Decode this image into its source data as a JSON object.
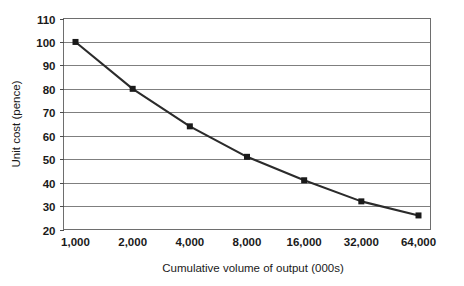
{
  "chart_data": {
    "type": "line",
    "title": "",
    "subtitle": "",
    "xlabel": "Cumulative volume of output (000s)",
    "ylabel": "Unit cost (pence)",
    "categories": [
      "1,000",
      "2,000",
      "4,000",
      "8,000",
      "16,000",
      "32,000",
      "64,000"
    ],
    "x_values": [
      1000,
      2000,
      4000,
      8000,
      16000,
      32000,
      64000
    ],
    "values": [
      100,
      80,
      64,
      51,
      41,
      32,
      26
    ],
    "series": [
      {
        "name": "Unit cost",
        "values": [
          100,
          80,
          64,
          51,
          41,
          32,
          26
        ]
      }
    ],
    "ylim": [
      20,
      110
    ],
    "y_ticks": [
      "20",
      "30",
      "40",
      "50",
      "60",
      "70",
      "80",
      "90",
      "100",
      "110"
    ],
    "y_tick_values": [
      20,
      30,
      40,
      50,
      60,
      70,
      80,
      90,
      100,
      110
    ],
    "x_scale": "log2-category",
    "grid": "horizontal",
    "legend": "none",
    "marker": "square",
    "colors": {
      "line": "#2b2b2b",
      "marker": "#1a1a1a",
      "gridline": "#7f7f7f",
      "axis": "#4d4d4d",
      "plot_background": "#ffffff",
      "text": "#1a1a1a"
    }
  }
}
